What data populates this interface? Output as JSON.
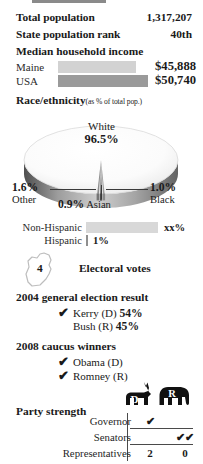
{
  "stats": [
    {
      "label": "Total population",
      "value": "1,317,207"
    },
    {
      "label": "State population rank",
      "value": "40th"
    }
  ],
  "income": {
    "heading": "Median household income",
    "rows": [
      {
        "name": "Maine",
        "amount": "$45,888",
        "bar_width": 78,
        "bar_color": "#d2d2d2"
      },
      {
        "name": "USA",
        "amount": "$50,740",
        "bar_width": 90,
        "bar_color": "#9a9a9a"
      }
    ]
  },
  "race": {
    "heading": "Race/ethnicity",
    "subheading": "(as % of total pop.)",
    "chart_data": {
      "type": "pie",
      "title": "Race/ethnicity",
      "unit": "% of total pop.",
      "categories": [
        "White",
        "Other",
        "Black",
        "Asian"
      ],
      "values": [
        96.5,
        1.6,
        1.0,
        0.9
      ],
      "labels": [
        "96.5%",
        "1.6%",
        "1.0%",
        "0.9%"
      ]
    },
    "main_slice": {
      "name": "White",
      "pct": "96.5%"
    },
    "callouts": [
      {
        "pct": "1.6%",
        "name": "Other"
      },
      {
        "pct": "1.0%",
        "name": "Black"
      },
      {
        "pct": "0.9%",
        "name": "Asian"
      }
    ]
  },
  "hispanic": {
    "rows": [
      {
        "name": "Non-Hispanic",
        "value": "xx%",
        "bar_width": 72,
        "bar_color": "#d8d8d8"
      },
      {
        "name": "Hispanic",
        "value": "1%",
        "bar_width": 2,
        "bar_color": "#8f8f8f"
      }
    ]
  },
  "electoral": {
    "count": "4",
    "label": "Electoral votes",
    "icon": "maine-state-outline"
  },
  "election_2004": {
    "heading": "2004 general election result",
    "rows": [
      {
        "winner": true,
        "check": "✔",
        "name": "Kerry (D)",
        "pct": "54%"
      },
      {
        "winner": false,
        "check": "",
        "name": "Bush (R)",
        "pct": "45%"
      }
    ]
  },
  "caucus_2008": {
    "heading": "2008 caucus winners",
    "rows": [
      {
        "check": "✔",
        "name": "Obama (D)"
      },
      {
        "check": "✔",
        "name": "Romney (R)"
      }
    ]
  },
  "party_strength": {
    "heading": "Party strength",
    "columns": [
      {
        "key": "D",
        "letter": "D",
        "icon": "donkey-icon"
      },
      {
        "key": "R",
        "letter": "R",
        "icon": "elephant-icon"
      }
    ],
    "rows": [
      {
        "label": "Governor",
        "d": "✔",
        "r": ""
      },
      {
        "label": "Senators",
        "d": "",
        "r": "✔✔"
      },
      {
        "label": "Representatives",
        "d": "2",
        "r": "0"
      }
    ]
  }
}
